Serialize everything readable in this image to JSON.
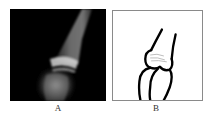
{
  "figure": {
    "panels": [
      {
        "id": "A",
        "label": "A",
        "description": "radiograph of finger joint (lateral view)",
        "background": "#000000"
      },
      {
        "id": "B",
        "label": "B",
        "description": "schematic line drawing of the joint",
        "background": "#ffffff",
        "border": "#8a8a8a"
      }
    ]
  }
}
